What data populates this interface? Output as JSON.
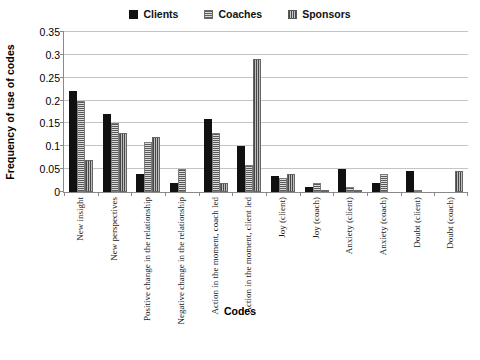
{
  "chart_data": {
    "type": "bar",
    "title": "",
    "xlabel": "Codes",
    "ylabel": "Frequency of use of codes",
    "ylim": [
      0,
      0.35
    ],
    "ytick_labels": [
      "0",
      "0.05",
      "0.1",
      "0.15",
      "0.2",
      "0.25",
      "0.3",
      "0.35"
    ],
    "ytick_values": [
      0,
      0.05,
      0.1,
      0.15,
      0.2,
      0.25,
      0.3,
      0.35
    ],
    "grid": "horizontal",
    "legend_position": "top-center",
    "categories": [
      "New insight",
      "New perspectives",
      "Positive change in the relationship",
      "Negative change in the relationship",
      "Action in the moment, coach led",
      "Action in the moment, client led",
      "Joy (client)",
      "Joy (coach)",
      "Anxiety (client)",
      "Anxiety (coach)",
      "Doubt (client)",
      "Doubt (coach)"
    ],
    "series": [
      {
        "name": "Clients",
        "color": "#111111",
        "pattern": "solid",
        "values": [
          0.22,
          0.17,
          0.04,
          0.02,
          0.16,
          0.1,
          0.035,
          0.01,
          0.05,
          0.02,
          0.045,
          0.0
        ]
      },
      {
        "name": "Coaches",
        "color": "#c6c6c6",
        "pattern": "horizontal-hatch",
        "values": [
          0.2,
          0.15,
          0.11,
          0.05,
          0.13,
          0.06,
          0.03,
          0.02,
          0.01,
          0.04,
          0.005,
          0.0
        ]
      },
      {
        "name": "Sponsors",
        "color": "#8d8d8d",
        "pattern": "vertical-hatch",
        "values": [
          0.07,
          0.13,
          0.12,
          0.0,
          0.02,
          0.29,
          0.04,
          0.005,
          0.005,
          0.0,
          0.0,
          0.045
        ]
      }
    ]
  },
  "caption": {
    "text": ""
  }
}
